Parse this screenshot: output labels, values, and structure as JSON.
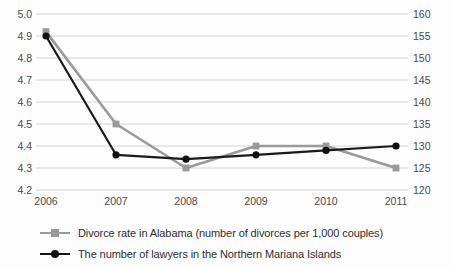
{
  "chart_data": {
    "type": "line",
    "title": "",
    "xlabel": "",
    "ylabel": "",
    "grid": true,
    "legend_position": "bottom-left",
    "categories": [
      "2006",
      "2007",
      "2008",
      "2009",
      "2010",
      "2011"
    ],
    "axes": {
      "x": {
        "tick_labels": [
          "2006",
          "2007",
          "2008",
          "2009",
          "2010",
          "2011"
        ]
      },
      "y_left": {
        "label": "",
        "ylim": [
          4.2,
          5.0
        ],
        "tick_labels": [
          "5.0",
          "4.9",
          "4.8",
          "4.7",
          "4.6",
          "4.5",
          "4.4",
          "4.3",
          "4.2"
        ],
        "ticks": [
          5.0,
          4.9,
          4.8,
          4.7,
          4.6,
          4.5,
          4.4,
          4.3,
          4.2
        ],
        "step": 0.1
      },
      "y_right": {
        "label": "",
        "ylim": [
          120,
          160
        ],
        "tick_labels": [
          "160",
          "155",
          "150",
          "145",
          "140",
          "135",
          "130",
          "125",
          "120"
        ],
        "ticks": [
          160,
          155,
          150,
          145,
          140,
          135,
          130,
          125,
          120
        ],
        "step": 5
      }
    },
    "series": [
      {
        "name": "Divorce rate in Alabama (number of divorces per 1,000 couples)",
        "axis": "left",
        "color": "#9a9a9a",
        "marker": "square",
        "values": [
          4.92,
          4.5,
          4.3,
          4.4,
          4.4,
          4.3
        ]
      },
      {
        "name": "The number of lawyers in the Northern Mariana Islands",
        "axis": "right",
        "color": "#141414",
        "marker": "circle",
        "values": [
          155,
          128,
          127,
          128,
          129,
          130
        ]
      }
    ]
  },
  "legend": {
    "items": [
      {
        "label": "Divorce rate in Alabama (number of divorces per 1,000 couples)"
      },
      {
        "label": "The number of lawyers in the Northern Mariana Islands"
      }
    ]
  }
}
